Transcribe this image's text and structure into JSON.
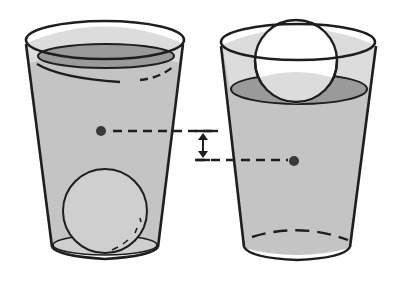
{
  "diagram": {
    "colors": {
      "outline": "#1e1e1e",
      "water_body": "#c4c4c4",
      "water_surface": "#9a9a9a",
      "cup_inner": "#dcdcdc",
      "sphere_submerged": "#cfcfcf",
      "sphere_floating": "#ffffff",
      "marker_dot": "#3a3a3a",
      "background": "#ffffff"
    },
    "left_cup": {
      "label": "",
      "sphere_position": "bottom",
      "marker_y": 131
    },
    "right_cup": {
      "label": "",
      "sphere_position": "floating",
      "marker_y": 161
    },
    "height_difference_arrow": {
      "top_y": 131,
      "bottom_y": 161
    }
  }
}
